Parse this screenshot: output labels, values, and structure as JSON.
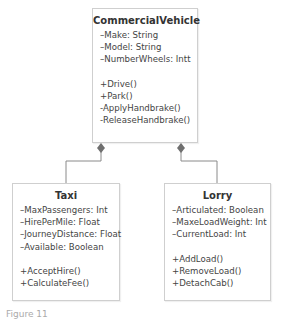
{
  "diagram": {
    "type": "uml-class-diagram",
    "colors": {
      "border": "#cfcfcf",
      "connector": "#777777",
      "text": "#333333"
    },
    "parent": {
      "name": "CommercialVehicle",
      "attributes": [
        "–Make: String",
        "–Model: String",
        "–NumberWheels: Intt"
      ],
      "methods": [
        "+Drive()",
        "+Park()",
        "-ApplyHandbrake()",
        "-ReleaseHandbrake()"
      ]
    },
    "children": [
      {
        "name": "Taxi",
        "attributes": [
          "–MaxPassengers: Int",
          "–HirePerMile: Float",
          "–JourneyDistance: Float",
          "–Available: Boolean"
        ],
        "methods": [
          "+AcceptHire()",
          "+CalculateFee()"
        ]
      },
      {
        "name": "Lorry",
        "attributes": [
          "–Articulated: Boolean",
          "–MaxeLoadWeight: Int",
          "–CurrentLoad: Int"
        ],
        "methods": [
          "+AddLoad()",
          "+RemoveLoad()",
          "+DetachCab()"
        ]
      }
    ],
    "relationships": [
      {
        "from": "Taxi",
        "to": "CommercialVehicle",
        "type": "composition"
      },
      {
        "from": "Lorry",
        "to": "CommercialVehicle",
        "type": "composition"
      }
    ],
    "caption": "Figure 11"
  }
}
